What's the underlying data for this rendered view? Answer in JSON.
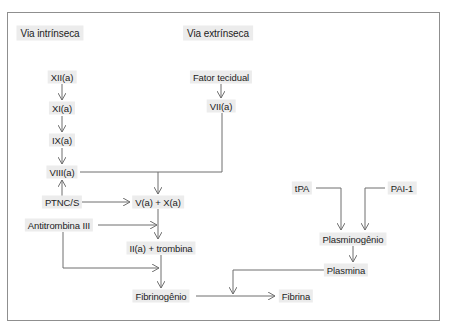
{
  "diagram": {
    "headers": {
      "intrinsic": "Via intrínseca",
      "extrinsic": "Via extrínseca"
    },
    "nodes": {
      "xii": "XII(a)",
      "xi": "XI(a)",
      "ix": "IX(a)",
      "viii": "VIII(a)",
      "tissue_factor": "Fator tecidual",
      "vii": "VII(a)",
      "ptnc": "PTNC/S",
      "antithrombin": "Antitrombina III",
      "vx": "V(a) + X(a)",
      "thrombin": "II(a) + trombina",
      "fibrinogen": "Fibrinogênio",
      "fibrin": "Fibrina",
      "tpa": "tPA",
      "pai": "PAI-1",
      "plasminogen": "Plasminogênio",
      "plasmin": "Plasmina"
    },
    "edges": [
      {
        "from": "XII(a)",
        "to": "XI(a)"
      },
      {
        "from": "XI(a)",
        "to": "IX(a)"
      },
      {
        "from": "IX(a)",
        "to": "VIII(a)"
      },
      {
        "from": "PTNC/S",
        "to": "VIII(a)"
      },
      {
        "from": "Fator tecidual",
        "to": "VII(a)"
      },
      {
        "from": "VIII(a)",
        "to": "V(a) + X(a)"
      },
      {
        "from": "VII(a)",
        "to": "V(a) + X(a)"
      },
      {
        "from": "PTNC/S",
        "to": "V(a) + X(a)"
      },
      {
        "from": "Antitrombina III",
        "to": "V(a) + X(a) → II(a) + trombina"
      },
      {
        "from": "V(a) + X(a)",
        "to": "II(a) + trombina"
      },
      {
        "from": "II(a) + trombina",
        "to": "Fibrinogênio"
      },
      {
        "from": "Antitrombina III",
        "to": "II(a) + trombina → Fibrinogênio"
      },
      {
        "from": "Fibrinogênio",
        "to": "Fibrina"
      },
      {
        "from": "Plasmina",
        "to": "Fibrinogênio → Fibrina"
      },
      {
        "from": "tPA",
        "to": "Plasminogênio"
      },
      {
        "from": "PAI-1",
        "to": "Plasminogênio"
      },
      {
        "from": "Plasminogênio",
        "to": "Plasmina"
      }
    ],
    "colors": {
      "line": "#6e6e6e",
      "label_bg": "#ececec",
      "frame": "#8f8f8f",
      "text": "#1c1c1c"
    }
  }
}
